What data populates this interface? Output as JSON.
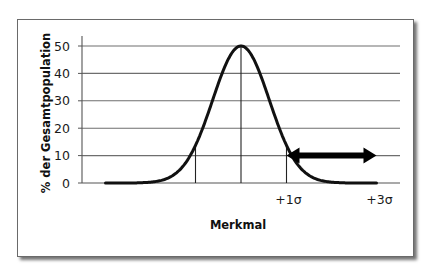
{
  "chart_data": {
    "type": "line",
    "title": "",
    "xlabel": "Merkmal",
    "ylabel": "% der Gesamtpopulation",
    "ylim": [
      0,
      50
    ],
    "yticks": [
      0,
      10,
      20,
      30,
      40,
      50
    ],
    "xtick_labels": [
      {
        "position_sigma": 1,
        "label": "+1σ"
      },
      {
        "position_sigma": 3,
        "label": "+3σ"
      }
    ],
    "grid": {
      "horizontal": true,
      "vertical": false
    },
    "legend": null,
    "series": [
      {
        "name": "Normalverteilung",
        "x_sigma": [
          -3,
          -2.5,
          -2,
          -1.5,
          -1,
          -0.75,
          -0.5,
          -0.25,
          0,
          0.25,
          0.5,
          0.75,
          1,
          1.5,
          2,
          2.5,
          3
        ],
        "values": [
          0,
          0.3,
          2,
          7,
          14,
          24,
          36,
          46,
          50,
          46,
          36,
          24,
          14,
          7,
          2,
          0.3,
          0
        ]
      }
    ],
    "vertical_markers_sigma": [
      -2,
      -1,
      0,
      1,
      2
    ],
    "annotations": [
      {
        "type": "double-arrow",
        "from_sigma": 1,
        "to_sigma": 3,
        "y": 10,
        "description": "Bereich oberhalb +1σ"
      }
    ],
    "layout": {
      "axis_x0_px": 82,
      "axis_x_end_px": 400,
      "center_px": 241,
      "sigma_px": 45.5,
      "curve_std_px": 28.3,
      "y0_px": 183,
      "y50_px": 46
    }
  }
}
